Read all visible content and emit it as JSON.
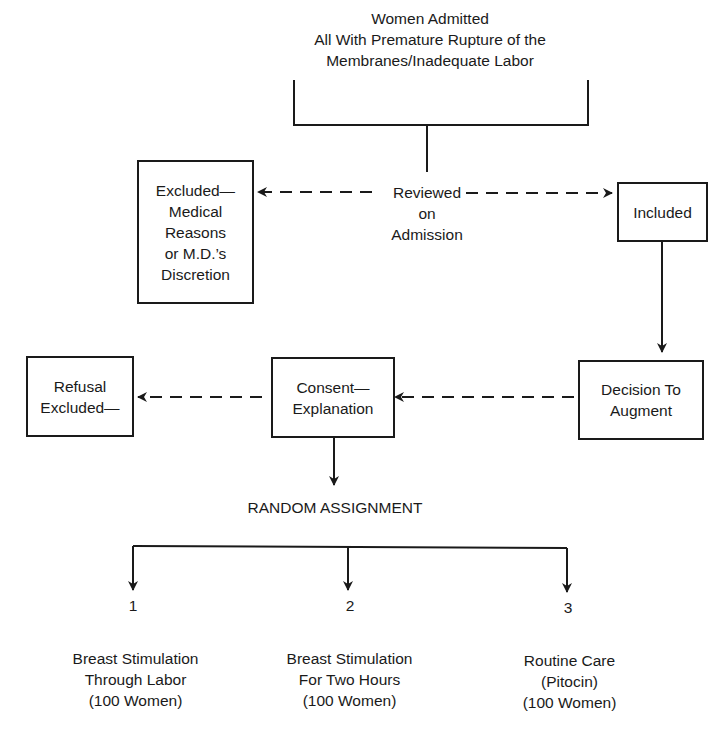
{
  "title": "Women Admitted\nAll With Premature Rupture of the\nMembranes/Inadequate Labor",
  "review": "Reviewed\non\nAdmission",
  "boxes": {
    "excluded_medical": "Excluded—\nMedical\nReasons\nor M.D.’s\nDiscretion",
    "included": "Included",
    "decision": "Decision To\nAugment",
    "consent": "Consent—\nExplanation",
    "refusal": "Refusal\nExcluded—"
  },
  "random_assignment": "RANDOM ASSIGNMENT",
  "groups": [
    {
      "number": "1",
      "label": "Breast Stimulation\nThrough Labor\n(100 Women)"
    },
    {
      "number": "2",
      "label": "Breast Stimulation\nFor Two Hours\n(100 Women)"
    },
    {
      "number": "3",
      "label": "Routine Care\n(Pitocin)\n(100 Women)"
    }
  ]
}
